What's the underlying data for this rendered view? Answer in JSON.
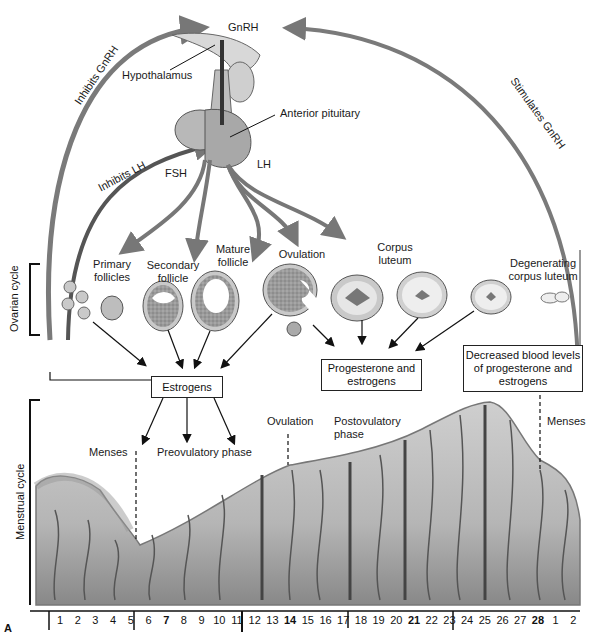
{
  "figure_label": "A",
  "top": {
    "gnrh": "GnRH",
    "hypothalamus": "Hypothalamus",
    "anterior_pituitary": "Anterior pituitary",
    "fsh": "FSH",
    "lh": "LH",
    "inhibits_gnrh": "Inhibits GnRH",
    "inhibits_lh": "Inhibits LH",
    "stimulates_gnrh": "Stimulates GnRH"
  },
  "ovarian": {
    "label": "Ovarian cycle",
    "stages": [
      {
        "label1": "Primary",
        "label2": "follicles"
      },
      {
        "label1": "Secondary",
        "label2": "follicle"
      },
      {
        "label1": "Mature",
        "label2": "follicle"
      },
      {
        "label1": "Ovulation",
        "label2": ""
      },
      {
        "label1": "Corpus",
        "label2": "luteum"
      },
      {
        "label1": "Degenerating",
        "label2": "corpus luteum"
      }
    ]
  },
  "boxes": {
    "estrogens": "Estrogens",
    "prog_est_1": "Progesterone and",
    "prog_est_2": "estrogens",
    "decreased_1": "Decreased blood levels",
    "decreased_2": "of progesterone and",
    "decreased_3": "estrogens"
  },
  "menstrual": {
    "label": "Menstrual cycle",
    "menses_left": "Menses",
    "preovulatory": "Preovulatory phase",
    "ovulation": "Ovulation",
    "postovulatory_1": "Postovulatory",
    "postovulatory_2": "phase",
    "menses_right": "Menses"
  },
  "days": [
    "1",
    "2",
    "3",
    "4",
    "5",
    "6",
    "7",
    "8",
    "9",
    "10",
    "11",
    "12",
    "13",
    "14",
    "15",
    "16",
    "17",
    "18",
    "19",
    "20",
    "21",
    "22",
    "23",
    "24",
    "25",
    "26",
    "27",
    "28",
    "1",
    "2"
  ],
  "bold_days": [
    "7",
    "14",
    "21",
    "28"
  ]
}
